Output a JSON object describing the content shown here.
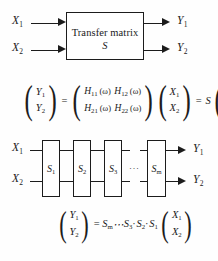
{
  "figure": {
    "background_color": "#fefefe",
    "line_color": "#1c1c1c"
  },
  "block_diagram": {
    "box": {
      "title": "Transfer matrix",
      "symbol": "S"
    },
    "inputs": [
      {
        "label": "X",
        "index": "1"
      },
      {
        "label": "X",
        "index": "2"
      }
    ],
    "outputs": [
      {
        "label": "Y",
        "index": "1"
      },
      {
        "label": "Y",
        "index": "2"
      }
    ]
  },
  "matrix_equation": {
    "lhs_vector": [
      {
        "base": "Y",
        "index": "1"
      },
      {
        "base": "Y",
        "index": "2"
      }
    ],
    "equals": "=",
    "matrix": {
      "rows": [
        [
          {
            "base": "H",
            "index": "11",
            "arg": "(ω)"
          },
          {
            "base": "H",
            "index": "12",
            "arg": "(ω)"
          }
        ],
        [
          {
            "base": "H",
            "index": "21",
            "arg": "(ω)"
          },
          {
            "base": "H",
            "index": "22",
            "arg": "(ω)"
          }
        ]
      ]
    },
    "input_vector": [
      {
        "base": "X",
        "index": "1"
      },
      {
        "base": "X",
        "index": "2"
      }
    ],
    "equals2": "=",
    "s_symbol": "S",
    "rhs_vector": [
      {
        "base": "X",
        "index": "1"
      },
      {
        "base": "X",
        "index": "2"
      }
    ]
  },
  "cascade_diagram": {
    "inputs": [
      {
        "label": "X",
        "index": "1"
      },
      {
        "label": "X",
        "index": "2"
      }
    ],
    "stages": [
      {
        "base": "S",
        "index": "1",
        "type": "box"
      },
      {
        "base": "S",
        "index": "2",
        "type": "box"
      },
      {
        "base": "S",
        "index": "3",
        "type": "box"
      },
      {
        "base": "···",
        "index": "",
        "type": "ellipsis"
      },
      {
        "base": "S",
        "index": "m",
        "type": "box"
      }
    ],
    "outputs": [
      {
        "label": "Y",
        "index": "1"
      },
      {
        "label": "Y",
        "index": "2"
      }
    ]
  },
  "cascade_equation": {
    "lhs_vector": [
      {
        "base": "Y",
        "index": "1"
      },
      {
        "base": "Y",
        "index": "2"
      }
    ],
    "equals": "=",
    "product": [
      {
        "base": "S",
        "index": "m",
        "sep": ""
      },
      {
        "base": "⋯",
        "index": "",
        "sep": ""
      },
      {
        "base": "S",
        "index": "3",
        "sep": "·"
      },
      {
        "base": "S",
        "index": "2",
        "sep": "·"
      },
      {
        "base": "S",
        "index": "1",
        "sep": ""
      }
    ],
    "rhs_vector": [
      {
        "base": "X",
        "index": "1"
      },
      {
        "base": "X",
        "index": "2"
      }
    ]
  }
}
